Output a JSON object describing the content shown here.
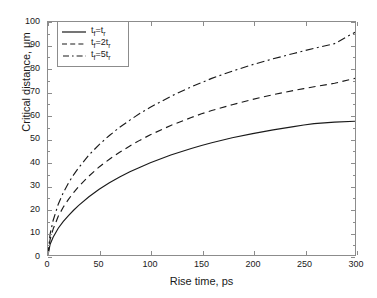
{
  "figure": {
    "background": "#ffffff",
    "axis_color": "#8c8c8c",
    "line_color": "#1a1a1a"
  },
  "axes": {
    "x": {
      "title": "Rise time, ps",
      "min": 0,
      "max": 300,
      "tick_step": 50,
      "ticks": [
        "0",
        "50",
        "100",
        "150",
        "200",
        "250",
        "300"
      ]
    },
    "y": {
      "title": "Critical distance, μm",
      "min": 0,
      "max": 100,
      "tick_step": 10,
      "ticks": [
        "0",
        "10",
        "20",
        "30",
        "40",
        "50",
        "60",
        "70",
        "80",
        "90",
        "100"
      ]
    }
  },
  "legend": {
    "position": "top-left",
    "boxed": true,
    "items": [
      {
        "label_main": "t",
        "label_sub1": "f",
        "label_eq": "=t",
        "label_sub2": "r",
        "label": "tf=tr",
        "style": "solid"
      },
      {
        "label_main": "t",
        "label_sub1": "f",
        "label_eq": "=2t",
        "label_sub2": "r",
        "label": "tf=2tr",
        "style": "dashed"
      },
      {
        "label_main": "t",
        "label_sub1": "f",
        "label_eq": "=5t",
        "label_sub2": "r",
        "label": "tf=5tr",
        "style": "dash-dot"
      }
    ]
  },
  "chart_data": {
    "type": "line",
    "title": "",
    "xlabel": "Rise time, ps",
    "ylabel": "Critical distance, μm",
    "xlim": [
      0,
      300
    ],
    "ylim": [
      0,
      100
    ],
    "xticks": [
      0,
      50,
      100,
      150,
      200,
      250,
      300
    ],
    "yticks": [
      0,
      10,
      20,
      30,
      40,
      50,
      60,
      70,
      80,
      90,
      100
    ],
    "grid": false,
    "legend_position": "upper left",
    "x": [
      0,
      2,
      5,
      10,
      15,
      20,
      25,
      30,
      40,
      50,
      60,
      70,
      80,
      90,
      100,
      120,
      140,
      150,
      160,
      180,
      200,
      220,
      240,
      250,
      260,
      280,
      300
    ],
    "series": [
      {
        "name": "tf=tr",
        "style": "solid",
        "values": [
          0,
          4.5,
          7.6,
          11.5,
          14.4,
          16.9,
          19.2,
          21.3,
          25.0,
          28.2,
          31.0,
          33.5,
          35.7,
          37.7,
          39.6,
          42.9,
          45.7,
          47.0,
          48.2,
          50.3,
          52.1,
          53.7,
          55.1,
          55.8,
          56.4,
          57.0,
          57.4
        ]
      },
      {
        "name": "tf=2tr",
        "style": "dashed",
        "values": [
          0,
          6.6,
          11.1,
          16.6,
          20.6,
          23.9,
          26.8,
          29.4,
          33.9,
          37.8,
          41.1,
          44.1,
          46.8,
          49.3,
          51.6,
          55.6,
          59.0,
          60.6,
          62.0,
          64.5,
          66.8,
          68.8,
          70.6,
          71.4,
          72.2,
          73.7,
          75.8
        ]
      },
      {
        "name": "tf=5tr",
        "style": "dash-dot",
        "values": [
          0,
          8.9,
          14.8,
          21.8,
          26.8,
          30.9,
          34.4,
          37.5,
          42.9,
          47.4,
          51.3,
          54.8,
          57.9,
          60.8,
          63.4,
          68.1,
          72.2,
          74.0,
          75.8,
          78.9,
          81.7,
          84.2,
          86.5,
          87.6,
          88.7,
          90.7,
          95.6
        ]
      }
    ]
  }
}
